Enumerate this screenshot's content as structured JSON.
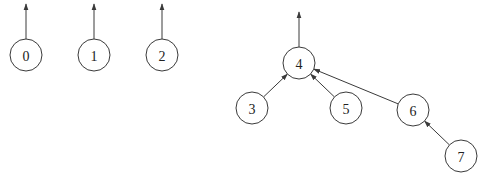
{
  "diagram": {
    "nodes": [
      {
        "id": "0",
        "label": "0"
      },
      {
        "id": "1",
        "label": "1"
      },
      {
        "id": "2",
        "label": "2"
      },
      {
        "id": "3",
        "label": "3"
      },
      {
        "id": "4",
        "label": "4"
      },
      {
        "id": "5",
        "label": "5"
      },
      {
        "id": "6",
        "label": "6"
      },
      {
        "id": "7",
        "label": "7"
      }
    ],
    "edges": [
      {
        "from": "3",
        "to": "4"
      },
      {
        "from": "5",
        "to": "4"
      },
      {
        "from": "6",
        "to": "4"
      },
      {
        "from": "7",
        "to": "6"
      }
    ],
    "roots": [
      "0",
      "1",
      "2",
      "4"
    ]
  }
}
